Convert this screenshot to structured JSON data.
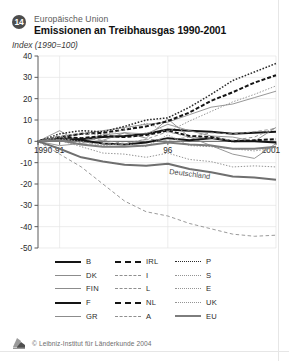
{
  "header": {
    "badge_number": "14",
    "supertitle": "Europäische Union",
    "title": "Emissionen an Treibhausgas 1990-2001",
    "subtitle": "Index (1990=100)"
  },
  "footer": {
    "copyright": "© Leibniz-Institut für Länderkunde 2004",
    "logo_icon": "leibniz-logo-icon"
  },
  "annotations": {
    "germany_label": "Deutschland"
  },
  "chart_data": {
    "type": "line",
    "title": "Emissionen an Treibhausgas 1990-2001",
    "subtitle": "Index (1990=100)",
    "xlabel": "",
    "ylabel": "Index (1990=100)",
    "grid": true,
    "legend_position": "bottom",
    "x": [
      1990,
      1991,
      1992,
      1993,
      1994,
      1995,
      1996,
      1997,
      1998,
      1999,
      2000,
      2001
    ],
    "xtick_values": [
      1990,
      1991,
      1996,
      2001
    ],
    "xtick_labels": [
      "1990",
      "91",
      "96",
      "2001"
    ],
    "ylim": [
      -50,
      40
    ],
    "ytick_values": [
      40,
      30,
      20,
      10,
      0,
      -10,
      -20,
      -30,
      -40,
      -50
    ],
    "ytick_labels": [
      "40",
      "30",
      "20",
      "10",
      "0",
      "-10",
      "-20",
      "-30",
      "-40",
      "-50"
    ],
    "series": [
      {
        "name": "B",
        "style": "thick-black-solid",
        "color": "#151515",
        "values": [
          0,
          1.5,
          1.0,
          2.0,
          2.5,
          3.5,
          5.5,
          5.0,
          4.5,
          3.5,
          4.0,
          4.5
        ]
      },
      {
        "name": "DK",
        "style": "thin-gray-solid",
        "color": "#8c8c8c",
        "values": [
          0,
          5.0,
          -1.0,
          3.0,
          4.0,
          1.5,
          10.5,
          2.0,
          -2.0,
          -6.0,
          -8.0,
          -1.0
        ]
      },
      {
        "name": "FIN",
        "style": "thin-gray-solid",
        "color": "#8c8c8c",
        "values": [
          0,
          -2.0,
          -1.0,
          0.5,
          4.0,
          3.5,
          8.0,
          5.0,
          2.5,
          2.0,
          0.0,
          6.5
        ]
      },
      {
        "name": "F",
        "style": "thick-black-solid",
        "color": "#151515",
        "values": [
          0,
          1.0,
          0.5,
          -1.0,
          -1.5,
          -0.5,
          1.5,
          0.5,
          1.5,
          0.0,
          0.0,
          -0.5
        ]
      },
      {
        "name": "GR",
        "style": "thin-gray-solid",
        "color": "#8c8c8c",
        "values": [
          0,
          2.0,
          3.5,
          5.0,
          6.5,
          8.0,
          9.0,
          12.5,
          16.0,
          17.5,
          20.5,
          23.5
        ]
      },
      {
        "name": "IRL",
        "style": "thick-black-dashed",
        "color": "#151515",
        "values": [
          0,
          2.0,
          3.5,
          4.0,
          5.5,
          7.0,
          9.5,
          13.5,
          19.0,
          23.0,
          27.5,
          31.0
        ]
      },
      {
        "name": "I",
        "style": "thin-gray-dashed",
        "color": "#8f8f8f",
        "values": [
          0,
          1.0,
          1.5,
          0.5,
          -1.0,
          1.0,
          0.5,
          2.0,
          4.0,
          3.5,
          4.5,
          6.0
        ]
      },
      {
        "name": "L",
        "style": "thin-gray-dashed",
        "color": "#8f8f8f",
        "values": [
          0,
          -6.0,
          -12.0,
          -20.0,
          -28.0,
          -33.0,
          -35.0,
          -38.5,
          -41.0,
          -43.5,
          -44.5,
          -44.0
        ]
      },
      {
        "name": "NL",
        "style": "thick-black-dashed",
        "color": "#151515",
        "values": [
          0,
          2.0,
          1.5,
          2.5,
          2.0,
          3.0,
          5.0,
          2.5,
          2.0,
          0.0,
          0.5,
          1.0
        ]
      },
      {
        "name": "A",
        "style": "thin-gray-dashed",
        "color": "#8f8f8f",
        "values": [
          0,
          2.5,
          -1.5,
          -1.0,
          -1.5,
          1.0,
          4.5,
          2.0,
          1.5,
          0.5,
          2.0,
          6.5
        ]
      },
      {
        "name": "P",
        "style": "black-dotted",
        "color": "#2a2a2a",
        "values": [
          0,
          3.5,
          5.0,
          4.5,
          7.0,
          10.0,
          11.0,
          16.0,
          22.0,
          28.5,
          32.5,
          36.5
        ]
      },
      {
        "name": "S",
        "style": "gray-dotted",
        "color": "#949494",
        "values": [
          0,
          1.0,
          0.0,
          -2.0,
          -1.0,
          -2.5,
          3.0,
          -2.0,
          -2.5,
          -3.5,
          -4.5,
          -3.0
        ]
      },
      {
        "name": "E",
        "style": "gray-dotted",
        "color": "#949494",
        "values": [
          0,
          2.0,
          4.0,
          3.0,
          5.5,
          8.5,
          4.5,
          9.5,
          14.0,
          18.5,
          22.0,
          26.0
        ]
      },
      {
        "name": "UK",
        "style": "gray-dotted",
        "color": "#949494",
        "values": [
          0,
          0.5,
          -2.5,
          -5.5,
          -6.0,
          -7.5,
          -5.5,
          -8.5,
          -9.5,
          -12.0,
          -11.5,
          -12.0
        ]
      },
      {
        "name": "EU",
        "style": "thick-gray-solid",
        "color": "#7d7d7d",
        "values": [
          0,
          0.5,
          -1.5,
          -2.5,
          -2.5,
          -2.0,
          -0.5,
          -1.5,
          -2.0,
          -3.5,
          -3.5,
          -2.5
        ]
      },
      {
        "name": "Deutschland",
        "style": "thick-gray-solid",
        "color": "#6f6f6f",
        "values": [
          0,
          -3.5,
          -7.5,
          -9.5,
          -11.0,
          -11.5,
          -10.5,
          -13.0,
          -14.5,
          -16.5,
          -17.0,
          -18.0
        ]
      }
    ]
  },
  "legend": {
    "columns": [
      {
        "items": [
          {
            "label": "B",
            "style": "ls-thickblack"
          },
          {
            "label": "DK",
            "style": "ls-thingray"
          },
          {
            "label": "FIN",
            "style": "ls-thingray"
          },
          {
            "label": "F",
            "style": "ls-thickblack"
          },
          {
            "label": "GR",
            "style": "ls-thingray"
          }
        ]
      },
      {
        "items": [
          {
            "label": "IRL",
            "style": "ls-dashblack"
          },
          {
            "label": "I",
            "style": "ls-dashgray"
          },
          {
            "label": "L",
            "style": "ls-dashgray"
          },
          {
            "label": "NL",
            "style": "ls-dashblack"
          },
          {
            "label": "A",
            "style": "ls-dashgray"
          }
        ]
      },
      {
        "items": [
          {
            "label": "P",
            "style": "ls-dotblack"
          },
          {
            "label": "S",
            "style": "ls-dotgray"
          },
          {
            "label": "E",
            "style": "ls-dotgray"
          },
          {
            "label": "UK",
            "style": "ls-dotgray"
          },
          {
            "label": "EU",
            "style": "ls-thickgray"
          }
        ]
      }
    ]
  }
}
